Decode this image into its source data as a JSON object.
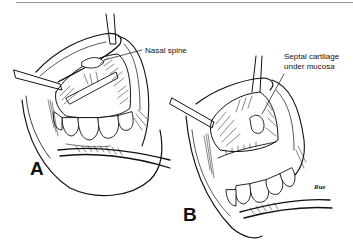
{
  "figure": {
    "panels": [
      {
        "id": "A",
        "letter": "A",
        "annotations": [
          {
            "text": "Nasal spine"
          }
        ]
      },
      {
        "id": "B",
        "letter": "B",
        "annotations": [
          {
            "line1": "Septal cartilage",
            "line2": "under mucosa"
          }
        ]
      }
    ],
    "signature": "Rue"
  }
}
